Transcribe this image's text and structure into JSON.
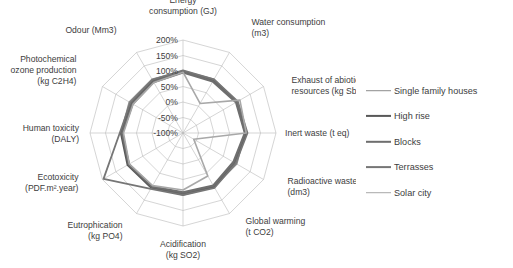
{
  "chart_data": {
    "type": "radar",
    "title": "",
    "categories": [
      "Energy consumption (GJ)",
      "Water consumption (m3)",
      "Exhaust of abiotic resources  (kg Sb)",
      "Inert waste (t eq)",
      "Radioactive waste (dm3)",
      "Global warming (t CO2)",
      "Acidification (kg SO2)",
      "Eutrophication (kg PO4)",
      "Ecotoxicity (PDF.m².year)",
      "Human toxicity (DALY)",
      "Photochemical ozone production (kg C2H4)",
      "Odour (Mm3)"
    ],
    "category_lines": [
      [
        "Energy",
        "consumption (GJ)"
      ],
      [
        "Water consumption",
        "(m3)"
      ],
      [
        "Exhaust of abiotic",
        "resources  (kg Sb)"
      ],
      [
        "Inert waste (t eq)"
      ],
      [
        "Radioactive waste",
        "(dm3)"
      ],
      [
        "Global warming",
        "(t CO2)"
      ],
      [
        "Acidification",
        "(kg SO2)"
      ],
      [
        "Eutrophication",
        "(kg PO4)"
      ],
      [
        "Ecotoxicity",
        "(PDF.m².year)"
      ],
      [
        "Human toxicity",
        "(DALY)"
      ],
      [
        "Photochemical",
        "ozone production",
        "(kg C2H4)"
      ],
      [
        "Odour (Mm3)"
      ]
    ],
    "tick_labels": [
      "200%",
      "150%",
      "100%",
      "50%",
      "0%",
      "-50%",
      "-100%"
    ],
    "tick_values": [
      200,
      150,
      100,
      50,
      0,
      -50,
      -100
    ],
    "rlim": [
      -100,
      200
    ],
    "grid": true,
    "legend_position": "right",
    "series": [
      {
        "name": "Single family houses",
        "color": "#8c8c8c",
        "width": 1.6,
        "values": [
          100,
          100,
          100,
          100,
          100,
          100,
          100,
          100,
          100,
          100,
          100,
          100
        ]
      },
      {
        "name": "High rise",
        "color": "#585858",
        "width": 2.2,
        "values": [
          98,
          95,
          100,
          104,
          92,
          100,
          96,
          104,
          106,
          100,
          92,
          94
        ]
      },
      {
        "name": "Blocks",
        "color": "#6e6e6e",
        "width": 2.4,
        "values": [
          96,
          92,
          98,
          100,
          88,
          96,
          92,
          100,
          102,
          96,
          88,
          90
        ]
      },
      {
        "name": "Terrasses",
        "color": "#767676",
        "width": 1.8,
        "values": [
          102,
          100,
          104,
          108,
          96,
          104,
          100,
          108,
          196,
          104,
          96,
          98
        ]
      },
      {
        "name": "Solar city",
        "color": "#a8a8a8",
        "width": 1.6,
        "values": [
          96,
          10,
          112,
          104,
          -60,
          60,
          84,
          96,
          100,
          92,
          86,
          88
        ]
      }
    ]
  },
  "legend": {
    "items": [
      {
        "label": "Single family houses"
      },
      {
        "label": "High rise"
      },
      {
        "label": "Blocks"
      },
      {
        "label": "Terrasses"
      },
      {
        "label": "Solar city"
      }
    ]
  }
}
